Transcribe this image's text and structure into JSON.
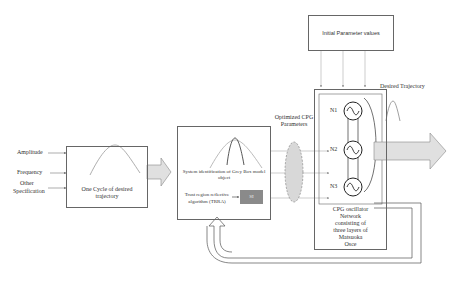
{
  "inputs": {
    "amplitude": "Amplitude",
    "frequency": "Frequency",
    "other_line1": "Other",
    "other_line2": "Specification"
  },
  "cycle_box": {
    "line1": "One Cycle of desired",
    "line2": "trajectory"
  },
  "sysid_box": {
    "line1": "System identification of Grey Box model",
    "line2": "object",
    "trra_line1": "Trust region reflective",
    "trra_line2": "algorithm (TRRA)",
    "si_label": "SI"
  },
  "optimized": {
    "line1": "Optimized CPG",
    "line2": "Parameters"
  },
  "initial_params": {
    "label": "Initial Parameter values"
  },
  "cpg_network": {
    "nodes": [
      "N1",
      "N2",
      "N3"
    ],
    "caption_lines": [
      "CPG oscillator",
      "Network",
      "consisting of",
      "three layers of",
      "Matsuoka",
      "Osce"
    ]
  },
  "output": {
    "label": "Desired Trajectory"
  },
  "colors": {
    "line": "#666666",
    "arrow_fill": "#e0e0e0",
    "si_fill": "#8a8a8a",
    "ellipse_fill": "#d8d8d8"
  }
}
